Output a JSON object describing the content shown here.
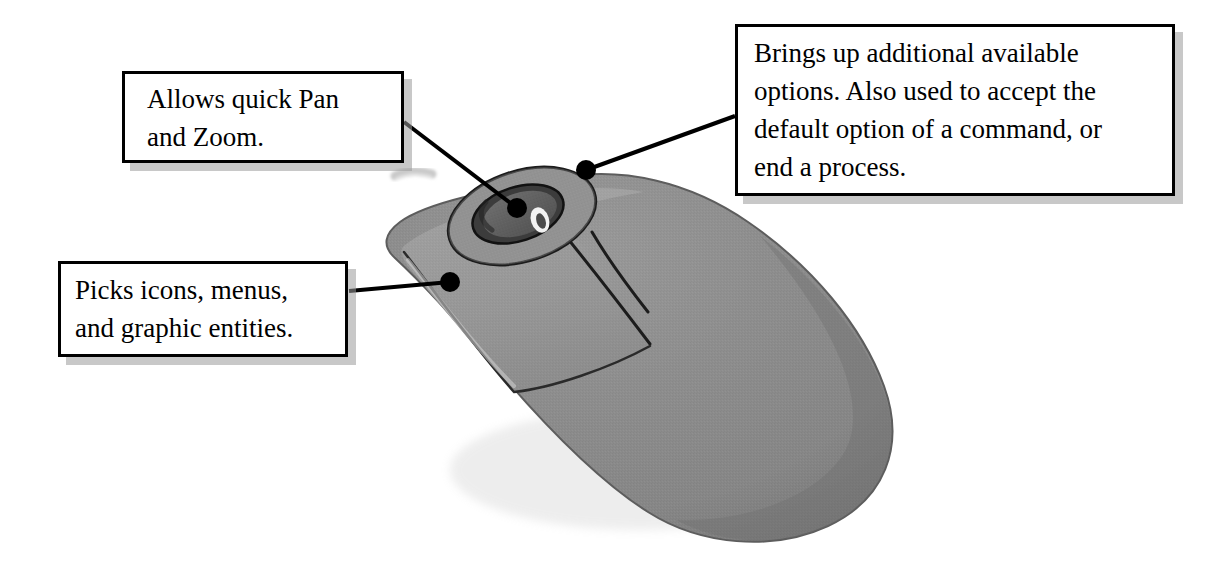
{
  "figure": {
    "body_color": "#8c8c8c",
    "button_color": "#969696",
    "outline_color": "#000000",
    "background_color": "#ffffff"
  },
  "callouts": [
    {
      "id": "pan-zoom",
      "name": "scroll-wheel-callout",
      "text": "Allows quick Pan\nand Zoom.",
      "target": "scroll-wheel"
    },
    {
      "id": "options",
      "name": "right-button-callout",
      "text": "Brings up additional available\noptions. Also used to accept the\ndefault option of a command, or\nend a process.",
      "target": "right-button"
    },
    {
      "id": "picks",
      "name": "left-button-callout",
      "text": "Picks icons, menus,\nand graphic entities.",
      "target": "left-button"
    }
  ],
  "leaders": [
    {
      "name": "leader-scroll-wheel",
      "from": [
        404,
        122
      ],
      "to": [
        517,
        208
      ]
    },
    {
      "name": "leader-right-button",
      "from": [
        735,
        116
      ],
      "to": [
        586,
        170
      ]
    },
    {
      "name": "leader-left-button",
      "from": [
        349,
        291
      ],
      "to": [
        450,
        282
      ]
    }
  ],
  "markers": [
    {
      "name": "marker-scroll-wheel",
      "cx": 517,
      "cy": 208,
      "r": 10
    },
    {
      "name": "marker-right-button",
      "cx": 586,
      "cy": 170,
      "r": 10
    },
    {
      "name": "marker-left-button",
      "cx": 450,
      "cy": 282,
      "r": 10
    }
  ]
}
